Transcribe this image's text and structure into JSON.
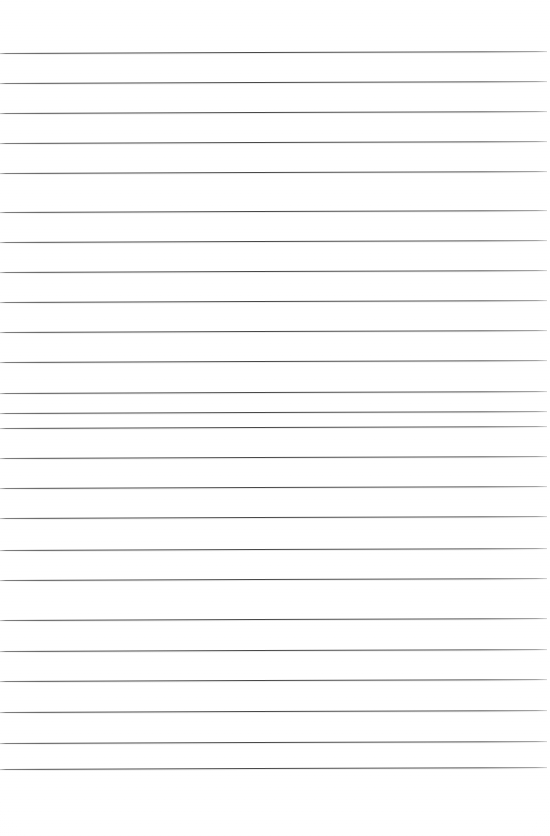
{
  "page": {
    "kind": "lined-paper-scan",
    "width": 550,
    "height": 836,
    "background_color": "#ffffff",
    "rule_color": "#4a4a4a",
    "rule_thickness_px": 1,
    "rule_spacing_px": 29.8,
    "rule_left_x": 0,
    "rule_right_x": 547,
    "skew_degrees": -0.21,
    "top_margin_px": 53,
    "bottom_margin_px": 67,
    "rule_count": 25,
    "written_text": ""
  },
  "rules": [
    {
      "index": 1,
      "y": 53
    },
    {
      "index": 2,
      "y": 83
    },
    {
      "index": 3,
      "y": 113
    },
    {
      "index": 4,
      "y": 143
    },
    {
      "index": 5,
      "y": 173
    },
    {
      "index": 6,
      "y": 212
    },
    {
      "index": 7,
      "y": 242
    },
    {
      "index": 8,
      "y": 272
    },
    {
      "index": 9,
      "y": 302
    },
    {
      "index": 10,
      "y": 332
    },
    {
      "index": 11,
      "y": 362
    },
    {
      "index": 12,
      "y": 393
    },
    {
      "index": 13,
      "y": 413
    },
    {
      "index": 14,
      "y": 428
    },
    {
      "index": 15,
      "y": 458
    },
    {
      "index": 16,
      "y": 488
    },
    {
      "index": 17,
      "y": 518
    },
    {
      "index": 18,
      "y": 550
    },
    {
      "index": 19,
      "y": 580
    },
    {
      "index": 20,
      "y": 620
    },
    {
      "index": 21,
      "y": 651
    },
    {
      "index": 22,
      "y": 681
    },
    {
      "index": 23,
      "y": 712
    },
    {
      "index": 24,
      "y": 743
    },
    {
      "index": 25,
      "y": 769
    }
  ]
}
